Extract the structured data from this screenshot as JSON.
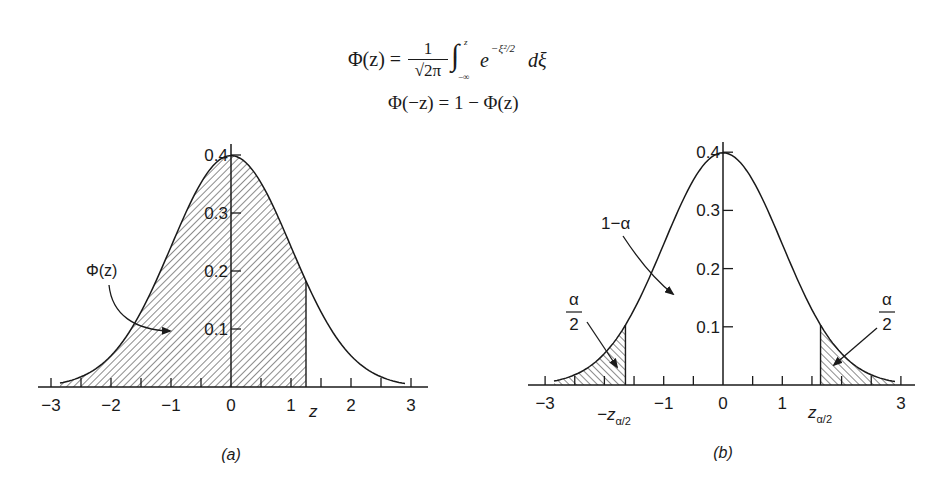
{
  "formula": {
    "line1": {
      "lhs": "Φ(z) =",
      "numerator": "1",
      "denominator": "√2π",
      "integral": "∫",
      "upper_limit": "z",
      "lower_limit": "−∞",
      "integrand": "e",
      "exponent": "−ξ²/2",
      "differential": "dξ"
    },
    "line2": "Φ(−z) = 1 − Φ(z)"
  },
  "colors": {
    "ink": "#1a1a1a",
    "background": "#ffffff",
    "hatch": "#1a1a1a"
  },
  "chart_data": [
    {
      "type": "area",
      "title": "(a)",
      "description": "Standard normal density with shaded cumulative area Φ(z) from −∞ to z",
      "xlabel": "z",
      "ylabel": "",
      "x_ticks": [
        -3,
        -2,
        -1,
        0,
        1,
        2,
        3
      ],
      "x_tick_labels": [
        "−3",
        "−2",
        "−1",
        "0",
        "1",
        "2",
        "3"
      ],
      "x_minor_ticks": [
        -2.5,
        -1.5,
        -0.5,
        0.5,
        1.5,
        2.5
      ],
      "y_ticks": [
        0.1,
        0.2,
        0.3,
        0.4
      ],
      "y_tick_labels": [
        "0.1",
        "0.2",
        "0.3",
        "0.4"
      ],
      "xlim": [
        -3.2,
        3.3
      ],
      "ylim": [
        0,
        0.4
      ],
      "curve": "pdf N(0,1)",
      "x": [
        -3,
        -2.5,
        -2,
        -1.5,
        -1,
        -0.5,
        0,
        0.5,
        1,
        1.5,
        2,
        2.5,
        3
      ],
      "values": [
        0.0044,
        0.0175,
        0.054,
        0.1295,
        0.242,
        0.3521,
        0.3989,
        0.3521,
        0.242,
        0.1295,
        0.054,
        0.0175,
        0.0044
      ],
      "shaded_region": {
        "from": "-inf",
        "to": 1.25,
        "label": "Φ(z)"
      },
      "annotations": [
        {
          "text": "Φ(z)",
          "points_to": "shaded area"
        },
        {
          "text": "z",
          "at_x": 1.25
        }
      ],
      "grid": false,
      "legend": "none"
    },
    {
      "type": "area",
      "title": "(b)",
      "description": "Standard normal density with two-sided tail areas α/2 beyond ±z_{α/2}",
      "xlabel": "",
      "ylabel": "",
      "x_ticks": [
        -3,
        -1,
        0,
        1,
        3
      ],
      "x_tick_labels": [
        "−3",
        "−1",
        "0",
        "1",
        "3"
      ],
      "x_minor_ticks": [
        -2.5,
        -2,
        -1.5,
        -0.5,
        0.5,
        1.5,
        2,
        2.5
      ],
      "y_ticks": [
        0.1,
        0.2,
        0.3,
        0.4
      ],
      "y_tick_labels": [
        "0.1",
        "0.2",
        "0.3",
        "0.4"
      ],
      "xlim": [
        -3.2,
        3.3
      ],
      "ylim": [
        0,
        0.4
      ],
      "curve": "pdf N(0,1)",
      "x": [
        -3,
        -2.5,
        -2,
        -1.5,
        -1,
        -0.5,
        0,
        0.5,
        1,
        1.5,
        2,
        2.5,
        3
      ],
      "values": [
        0.0044,
        0.0175,
        0.054,
        0.1295,
        0.242,
        0.3521,
        0.3989,
        0.3521,
        0.242,
        0.1295,
        0.054,
        0.0175,
        0.0044
      ],
      "shaded_regions": [
        {
          "from": "-inf",
          "to": -1.645,
          "label": "α/2"
        },
        {
          "from": 1.645,
          "to": "inf",
          "label": "α/2"
        }
      ],
      "critical_values": {
        "lower": "−z_{α/2}",
        "upper": "z_{α/2}",
        "value": 1.645
      },
      "annotations": [
        {
          "text": "1−α",
          "points_to": "central area"
        },
        {
          "text": "α/2",
          "points_to": "left tail"
        },
        {
          "text": "α/2",
          "points_to": "right tail"
        },
        {
          "text": "−z α/2",
          "at_x": -1.645
        },
        {
          "text": "z α/2",
          "at_x": 1.645
        }
      ],
      "grid": false,
      "legend": "none"
    }
  ],
  "labels": {
    "a": {
      "phi_label": "Φ(z)",
      "z_label": "z",
      "caption": "(a)"
    },
    "b": {
      "one_minus_alpha": "1−α",
      "alpha": "α",
      "two": "2",
      "neg_z": "−z",
      "pos_z": "z",
      "subscript": "α/2",
      "caption": "(b)"
    }
  }
}
